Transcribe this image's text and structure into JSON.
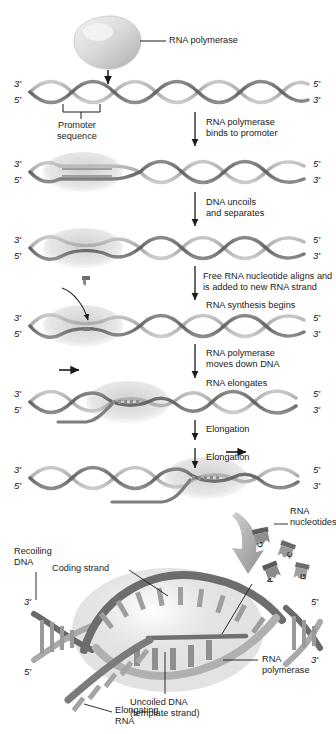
{
  "figure": {
    "type": "biology-process-diagram"
  },
  "colors": {
    "strand_dark": "#6e6e6e",
    "strand_light": "#b3b3b3",
    "polymerase_fill": "#d9d9d9",
    "bubble_fill": "#d2d2d2",
    "rna_strand": "#7a7a7a",
    "text": "#1b1b1b",
    "background": "#ffffff"
  },
  "top_labels": {
    "polymerase": "RNA polymerase",
    "promoter": "Promoter\nsequence"
  },
  "steps": [
    {
      "id": "step-1",
      "text": "RNA polymerase\nbinds to promoter"
    },
    {
      "id": "step-2",
      "text": "DNA uncoils\nand separates"
    },
    {
      "id": "step-3",
      "text": "Free RNA nucleotide aligns and\nis added to new RNA strand"
    },
    {
      "id": "step-3b",
      "text": "RNA synthesis begins"
    },
    {
      "id": "step-4",
      "text": "RNA polymerase\nmoves down DNA"
    },
    {
      "id": "step-4b",
      "text": "RNA elongates"
    },
    {
      "id": "step-5",
      "text": "Elongation"
    },
    {
      "id": "step-6",
      "text": "Elongation"
    }
  ],
  "strand_ends": {
    "left_top": "3ʹ",
    "left_bottom": "5ʹ",
    "right_top": "5ʹ",
    "right_bottom": "3ʹ"
  },
  "rows": [
    {
      "id": "row-1",
      "y": 92,
      "label": "naked-dna-with-promoter"
    },
    {
      "id": "row-2",
      "y": 172,
      "label": "polymerase-bound"
    },
    {
      "id": "row-3",
      "y": 248,
      "label": "dna-uncoiled"
    },
    {
      "id": "row-4",
      "y": 326,
      "label": "rna-synthesis-begins"
    },
    {
      "id": "row-5",
      "y": 402,
      "label": "rna-elongating"
    },
    {
      "id": "row-6",
      "y": 478,
      "label": "rna-elongated-further"
    }
  ],
  "detail": {
    "labels": {
      "rna_nucleotides": "RNA\nnucleotides",
      "coding_strand": "Coding strand",
      "recoiling_dna": "Recoiling\nDNA",
      "rna_polymerase": "RNA\npolymerase",
      "uncoiled_dna": "Uncoiled DNA\n(template strand)",
      "elongating_rna": "Elongating\nRNA"
    },
    "primes": {
      "left_top": "3ʹ",
      "left_bottom": "5ʹ",
      "right_top": "5ʹ",
      "right_bottom": "3ʹ"
    },
    "free_nucleotides": [
      "G",
      "C",
      "A",
      "G"
    ]
  }
}
